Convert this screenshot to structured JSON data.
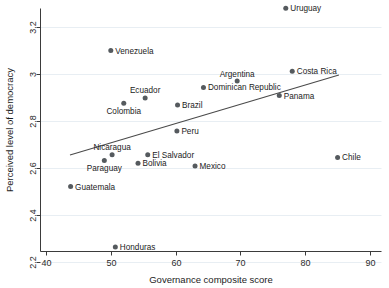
{
  "chart_data": {
    "type": "scatter",
    "title": "",
    "xlabel": "Governance composite score",
    "ylabel": "Perceived level of democracy",
    "xlim": [
      40,
      90
    ],
    "ylim": [
      2.2,
      3.3
    ],
    "xticks": [
      "40",
      "50",
      "60",
      "70",
      "80",
      "90"
    ],
    "xtick_values": [
      40,
      50,
      60,
      70,
      80,
      90
    ],
    "yticks": [
      "2.2",
      "2.4",
      "2.6",
      "2.8",
      "3",
      "3.2"
    ],
    "ytick_values": [
      2.2,
      2.4,
      2.6,
      2.8,
      3.0,
      3.2
    ],
    "grid": true,
    "legend": "none",
    "marker_color": "#555a5e",
    "trendline_color": "#4a4a4a",
    "axis_color": "#3b3b3b",
    "gridline_color": "#e8eef3",
    "points": [
      {
        "label": "Uruguay",
        "x": 77.0,
        "y": 3.28,
        "label_pos": "right"
      },
      {
        "label": "Venezuela",
        "x": 50.0,
        "y": 3.1,
        "label_pos": "right"
      },
      {
        "label": "Costa Rica",
        "x": 78.0,
        "y": 3.012,
        "label_pos": "right"
      },
      {
        "label": "Argentina",
        "x": 69.5,
        "y": 2.97,
        "label_pos": "above"
      },
      {
        "label": "Dominican Republic",
        "x": 64.3,
        "y": 2.943,
        "label_pos": "right"
      },
      {
        "label": "Panama",
        "x": 76.0,
        "y": 2.908,
        "label_pos": "right"
      },
      {
        "label": "Ecuador",
        "x": 55.3,
        "y": 2.898,
        "label_pos": "above"
      },
      {
        "label": "Colombia",
        "x": 52.0,
        "y": 2.876,
        "label_pos": "below"
      },
      {
        "label": "Brazil",
        "x": 60.3,
        "y": 2.868,
        "label_pos": "right"
      },
      {
        "label": "Peru",
        "x": 60.2,
        "y": 2.757,
        "label_pos": "right"
      },
      {
        "label": "Nicaragua",
        "x": 50.2,
        "y": 2.656,
        "label_pos": "above"
      },
      {
        "label": "El Salvador",
        "x": 55.7,
        "y": 2.656,
        "label_pos": "right"
      },
      {
        "label": "Chile",
        "x": 85.0,
        "y": 2.645,
        "label_pos": "right"
      },
      {
        "label": "Paraguay",
        "x": 49.0,
        "y": 2.632,
        "label_pos": "below"
      },
      {
        "label": "Bolivia",
        "x": 54.2,
        "y": 2.62,
        "label_pos": "right"
      },
      {
        "label": "Mexico",
        "x": 63.0,
        "y": 2.608,
        "label_pos": "right"
      },
      {
        "label": "Guatemala",
        "x": 43.8,
        "y": 2.521,
        "label_pos": "right"
      },
      {
        "label": "Honduras",
        "x": 50.7,
        "y": 2.264,
        "label_pos": "right"
      }
    ],
    "trendline": {
      "x0": 43.7,
      "y0": 2.655,
      "x1": 85.2,
      "y1": 2.996
    }
  }
}
